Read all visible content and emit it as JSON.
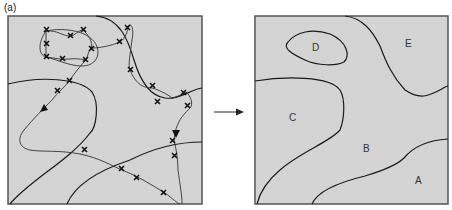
{
  "figure": {
    "label": "(a)",
    "left_panel": {
      "description": "Sampled trajectories with observation points (x markers) across region boundaries",
      "marker_symbol": "×",
      "arrow_markers": 2
    },
    "arrow": {
      "direction": "right"
    },
    "right_panel": {
      "description": "Inferred regions separated by boundaries",
      "regions": [
        {
          "id": "D",
          "label": "D"
        },
        {
          "id": "E",
          "label": "E"
        },
        {
          "id": "C",
          "label": "C"
        },
        {
          "id": "B",
          "label": "B"
        },
        {
          "id": "A",
          "label": "A"
        }
      ]
    },
    "colors": {
      "panel_fill": "#d4d4d4",
      "panel_border": "#555555",
      "line": "#1a1a1a",
      "background": "#ffffff"
    }
  }
}
